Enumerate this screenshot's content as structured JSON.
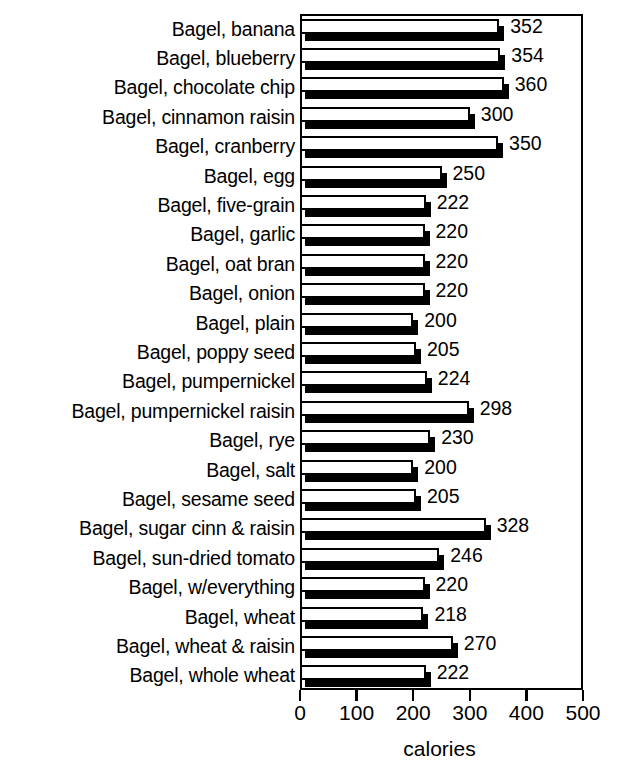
{
  "chart_data": {
    "type": "bar",
    "orientation": "horizontal",
    "title": "",
    "xlabel": "calories",
    "ylabel": "",
    "xlim": [
      0,
      500
    ],
    "xticks": [
      0,
      100,
      200,
      300,
      400,
      500
    ],
    "grid": false,
    "legend": null,
    "value_labels_shown": true,
    "categories": [
      "Bagel, banana",
      "Bagel, blueberry",
      "Bagel, chocolate chip",
      "Bagel, cinnamon raisin",
      "Bagel, cranberry",
      "Bagel, egg",
      "Bagel, five-grain",
      "Bagel, garlic",
      "Bagel, oat bran",
      "Bagel, onion",
      "Bagel, plain",
      "Bagel, poppy seed",
      "Bagel, pumpernickel",
      "Bagel, pumpernickel raisin",
      "Bagel, rye",
      "Bagel, salt",
      "Bagel, sesame seed",
      "Bagel, sugar cinn & raisin",
      "Bagel, sun-dried tomato",
      "Bagel, w/everything",
      "Bagel, wheat",
      "Bagel, wheat & raisin",
      "Bagel, whole wheat"
    ],
    "values": [
      352,
      354,
      360,
      300,
      350,
      250,
      222,
      220,
      220,
      220,
      200,
      205,
      224,
      298,
      230,
      200,
      205,
      328,
      246,
      220,
      218,
      270,
      222
    ],
    "value_label_text": [
      "352",
      "354",
      "360",
      "300",
      "350",
      "250",
      "222",
      "220",
      "220",
      "220",
      "200",
      "205",
      "224",
      "298",
      "230",
      "200",
      "205",
      "328",
      "246",
      "220",
      "218",
      "270",
      "222"
    ],
    "xtick_labels": [
      "0",
      "100",
      "200",
      "300",
      "400",
      "500"
    ],
    "style": {
      "bar_fill": "#ffffff",
      "bar_outline": "#000000",
      "bar_shadow": "#000000",
      "background": "#ffffff",
      "text": "#000000"
    }
  }
}
